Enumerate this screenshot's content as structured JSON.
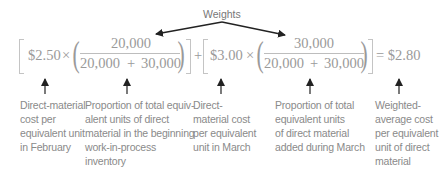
{
  "weights_label": "Weights",
  "formula": {
    "term1": {
      "cost": "$2.50",
      "times": "×",
      "numerator": "20,000",
      "denominator_a": "20,000",
      "plus": "+",
      "denominator_b": "30,000"
    },
    "plus": "+",
    "term2": {
      "cost": "$3.00",
      "times": "×",
      "numerator": "30,000",
      "denominator_a": "20,000",
      "plus": "+",
      "denominator_b": "30,000"
    },
    "equals": "= $2.80"
  },
  "annotations": [
    {
      "lines": [
        "Direct-material",
        "cost per",
        "equivalent unit",
        "in February"
      ]
    },
    {
      "lines": [
        "Proportion of total equiv-",
        "alent units of direct",
        "material in the beginning",
        "work-in-process",
        "inventory"
      ]
    },
    {
      "lines": [
        "Direct-",
        "material cost",
        "per equivalent",
        "unit in March"
      ]
    },
    {
      "lines": [
        "Proportion of total",
        "equivalent units",
        "of direct material",
        "added during March"
      ]
    },
    {
      "lines": [
        "Weighted-",
        "average cost",
        "per equivalent",
        "unit of direct",
        "material"
      ]
    }
  ],
  "colors": {
    "text": "#8a8a8a",
    "arrow": "#222222"
  }
}
